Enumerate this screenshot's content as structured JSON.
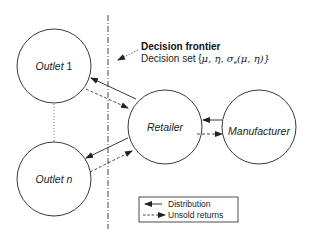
{
  "nodes": {
    "outlet1": {
      "label": "Outlet",
      "suffix": " 1"
    },
    "outletn": {
      "label": "Outlet",
      "suffix": " n"
    },
    "retailer": {
      "label": "Retailer"
    },
    "manufacturer": {
      "label": "Manufacturer"
    }
  },
  "frontier": {
    "title": "Decision frontier",
    "subtitle_prefix": "Decision set {",
    "subtitle_math": "μ, η, σ",
    "subtitle_sub": "e",
    "subtitle_end": "(μ, η)}"
  },
  "legend": {
    "distribution": "Distribution",
    "unsold_returns": "Unsold returns"
  },
  "colors": {
    "stroke": "#222222",
    "background": "#ffffff"
  }
}
